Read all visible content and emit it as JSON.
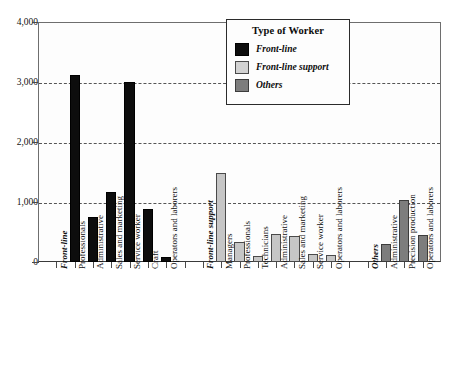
{
  "chart_data": {
    "type": "bar",
    "title": "",
    "xlabel": "",
    "ylabel": "",
    "ylim": [
      0,
      4000
    ],
    "grid": true,
    "legend_position": "top-right",
    "y_ticks": [
      {
        "value": 0,
        "label": "0"
      },
      {
        "value": 1000,
        "label": "1,000"
      },
      {
        "value": 2000,
        "label": "2,000"
      },
      {
        "value": 3000,
        "label": "3,000"
      },
      {
        "value": 4000,
        "label": "4,000"
      }
    ],
    "legend": {
      "title": "Type of Worker",
      "entries": [
        {
          "name": "Front-line",
          "color": "#0d0d0d"
        },
        {
          "name": "Front-line support",
          "color": "#d2d2d2"
        },
        {
          "name": "Others",
          "color": "#7d7d7d"
        }
      ]
    },
    "groups": [
      {
        "name": "Front-line",
        "series": "front-line",
        "color": "#0d0d0d",
        "categories": [
          "Professionals",
          "Administrative",
          "Sales and marketing",
          "Service worker",
          "Craft",
          "Operators and laborers"
        ],
        "values": [
          3110,
          750,
          1170,
          3000,
          880,
          90
        ]
      },
      {
        "name": "Front-line support",
        "series": "fl-support",
        "color": "#c6c6c6",
        "categories": [
          "Managers",
          "Professionals",
          "Technicians",
          "Administrative",
          "Sales and marketing",
          "Service worker",
          "Operators and laborers"
        ],
        "values": [
          1480,
          340,
          100,
          470,
          440,
          130,
          110
        ]
      },
      {
        "name": "Others",
        "series": "others",
        "color": "#7d7d7d",
        "categories": [
          "Administrative",
          "Precision production",
          "Operators and laborers"
        ],
        "values": [
          300,
          1030,
          450
        ]
      }
    ]
  }
}
